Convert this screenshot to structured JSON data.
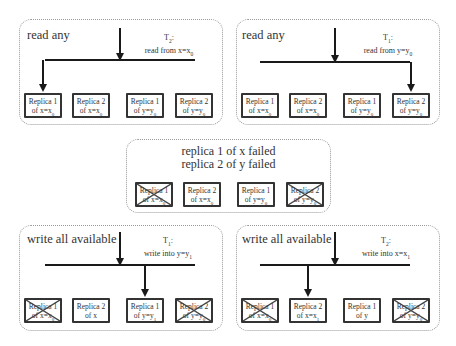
{
  "panels": [
    {
      "id": "read-x",
      "title": "read any",
      "transaction": {
        "name": "T",
        "sub": "2",
        "action": "read from x=x",
        "action_sub": "0"
      },
      "target_replica_index": 0,
      "replicas": [
        {
          "label": "Replica 1",
          "of": "of x=x",
          "sub": "0",
          "failed": false
        },
        {
          "label": "Replica 2",
          "of": "of x=x",
          "sub": "0",
          "failed": false
        },
        {
          "label": "Replica 1",
          "of": "of y=y",
          "sub": "0",
          "failed": false
        },
        {
          "label": "Replica 2",
          "of": "of y=y",
          "sub": "0",
          "failed": false
        }
      ]
    },
    {
      "id": "read-y",
      "title": "read any",
      "transaction": {
        "name": "T",
        "sub": "1",
        "action": "read from y=y",
        "action_sub": "0"
      },
      "target_replica_index": 3,
      "replicas": [
        {
          "label": "Replica 1",
          "of": "of x=x",
          "sub": "0",
          "failed": false
        },
        {
          "label": "Replica 2",
          "of": "of x=x",
          "sub": "0",
          "failed": false
        },
        {
          "label": "Replica 1",
          "of": "of y=y",
          "sub": "0",
          "failed": false
        },
        {
          "label": "Replica 2",
          "of": "of y=y",
          "sub": "0",
          "failed": false
        }
      ]
    },
    {
      "id": "failure",
      "title_lines": [
        "replica 1 of x failed",
        "replica 2 of y failed"
      ],
      "replicas": [
        {
          "label": "Replica 1",
          "of": "of x=x",
          "sub": "0",
          "failed": true
        },
        {
          "label": "Replica 2",
          "of": "of x=x",
          "sub": "0",
          "failed": false
        },
        {
          "label": "Replica 1",
          "of": "of y=y",
          "sub": "0",
          "failed": false
        },
        {
          "label": "Replica 2",
          "of": "of y=y",
          "sub": "0",
          "failed": true
        }
      ]
    },
    {
      "id": "write-y",
      "title": "write all available",
      "transaction": {
        "name": "T",
        "sub": "1",
        "action": "write into y=y",
        "action_sub": "1"
      },
      "target_replica_index": 2,
      "replicas": [
        {
          "label": "Replica 1",
          "of": "of x=x",
          "sub": "0",
          "failed": true
        },
        {
          "label": "Replica 2",
          "of": "of x",
          "sub": "",
          "failed": false
        },
        {
          "label": "Replica 1",
          "of": "of y=y",
          "sub": "1",
          "failed": false
        },
        {
          "label": "Replica 2",
          "of": "of y=y",
          "sub": "0",
          "failed": true
        }
      ]
    },
    {
      "id": "write-x",
      "title": "write all available",
      "transaction": {
        "name": "T",
        "sub": "2",
        "action": "write into x=x",
        "action_sub": "1"
      },
      "target_replica_index": 1,
      "replicas": [
        {
          "label": "Replica 1",
          "of": "of x=x",
          "sub": "0",
          "failed": true
        },
        {
          "label": "Replica 2",
          "of": "of x=x",
          "sub": "1",
          "failed": false
        },
        {
          "label": "Replica 1",
          "of": "of y",
          "sub": "",
          "failed": false
        },
        {
          "label": "Replica 2",
          "of": "of y=y",
          "sub": "0",
          "failed": true
        }
      ]
    }
  ]
}
